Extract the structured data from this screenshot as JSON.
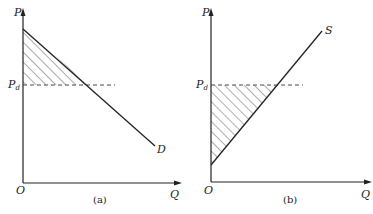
{
  "figure": {
    "panels": [
      {
        "id": "a",
        "caption": "(a)",
        "y_axis_label": "P",
        "x_axis_label": "Q",
        "origin_label": "O",
        "price_label_main": "P",
        "price_label_sub": "d",
        "curve_label": "D",
        "curve_type": "demand (downward sloping)",
        "shaded_region": "area above Pd and below D (consumer surplus)"
      },
      {
        "id": "b",
        "caption": "(b)",
        "y_axis_label": "P",
        "x_axis_label": "Q",
        "origin_label": "O",
        "price_label_main": "P",
        "price_label_sub": "d",
        "curve_label": "S",
        "curve_type": "supply (upward sloping)",
        "shaded_region": "area below Pd and above S (producer surplus)"
      }
    ],
    "colors": {
      "ink": "#222222",
      "background": "#ffffff"
    }
  }
}
